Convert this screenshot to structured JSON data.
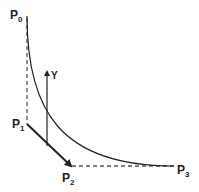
{
  "diagram": {
    "points": [
      {
        "id": "P0",
        "label": "P",
        "sub": "0"
      },
      {
        "id": "P1",
        "label": "P",
        "sub": "1"
      },
      {
        "id": "P2",
        "label": "P",
        "sub": "2"
      },
      {
        "id": "P3",
        "label": "P",
        "sub": "3"
      }
    ],
    "y_axis_label": "Y",
    "colors": {
      "line": "#222222",
      "dashed": "#555555",
      "background": "#ffffff"
    }
  }
}
